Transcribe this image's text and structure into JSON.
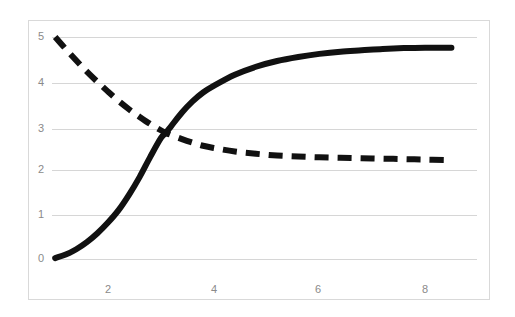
{
  "chart_data": {
    "type": "line",
    "title": "",
    "subtitle": "",
    "xlabel": "",
    "ylabel": "",
    "xlim": [
      0.8,
      9.0
    ],
    "ylim": [
      0,
      5.2
    ],
    "xticks": [
      2,
      4,
      6,
      8
    ],
    "yticks": [
      0,
      1,
      2,
      3,
      4,
      5
    ],
    "xtick_labels": [
      "2",
      "4",
      "6",
      "8"
    ],
    "ytick_labels": [
      "0",
      "1",
      "2",
      "3",
      "4",
      "5"
    ],
    "grid": "horizontal",
    "grid_color": "#d6d6d6",
    "legend": "none",
    "background": "#ffffff",
    "border_color": "#d9d9d9",
    "annotations": [],
    "crossing_point": {
      "x": 3.1,
      "y": 2.82
    },
    "series": [
      {
        "name": "rising-curve",
        "style": "solid",
        "color": "#111111",
        "width": 6,
        "x": [
          1.0,
          1.2,
          1.4,
          1.6,
          1.8,
          2.0,
          2.2,
          2.4,
          2.6,
          2.8,
          3.0,
          3.1,
          3.2,
          3.4,
          3.6,
          3.8,
          4.0,
          4.4,
          4.8,
          5.2,
          5.6,
          6.0,
          6.4,
          6.8,
          7.2,
          7.6,
          8.0,
          8.4,
          8.5
        ],
        "values": [
          0.02,
          0.1,
          0.22,
          0.38,
          0.58,
          0.82,
          1.1,
          1.45,
          1.85,
          2.3,
          2.72,
          2.85,
          3.0,
          3.3,
          3.55,
          3.75,
          3.9,
          4.15,
          4.33,
          4.46,
          4.55,
          4.62,
          4.67,
          4.7,
          4.73,
          4.75,
          4.76,
          4.76,
          4.76
        ]
      },
      {
        "name": "falling-curve",
        "style": "dashed",
        "color": "#111111",
        "width": 6,
        "dash": "14 9",
        "x": [
          1.0,
          1.2,
          1.4,
          1.6,
          1.8,
          2.0,
          2.2,
          2.4,
          2.6,
          2.8,
          3.0,
          3.1,
          3.2,
          3.4,
          3.6,
          3.8,
          4.0,
          4.4,
          4.8,
          5.2,
          5.6,
          6.0,
          6.4,
          6.8,
          7.2,
          7.6,
          8.0,
          8.4,
          8.5
        ],
        "values": [
          5.0,
          4.73,
          4.47,
          4.22,
          3.99,
          3.77,
          3.56,
          3.37,
          3.2,
          3.04,
          2.9,
          2.84,
          2.79,
          2.7,
          2.62,
          2.55,
          2.5,
          2.42,
          2.37,
          2.33,
          2.31,
          2.29,
          2.28,
          2.27,
          2.26,
          2.25,
          2.24,
          2.23,
          2.22
        ]
      }
    ]
  },
  "axes": {
    "x_tick_positions_px": [
      108,
      214,
      318,
      425
    ],
    "y_tick_positions_px": [
      259,
      215,
      170,
      129,
      83,
      37
    ]
  }
}
